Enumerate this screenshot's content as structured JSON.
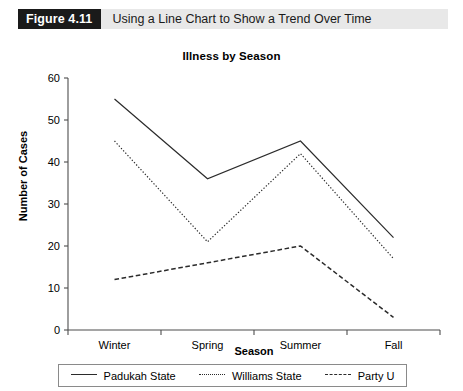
{
  "figure": {
    "number": "Figure 4.11",
    "caption": "Using a Line Chart to Show a Trend Over Time"
  },
  "chart_data": {
    "type": "line",
    "title": "Illness by Season",
    "xlabel": "Season",
    "ylabel": "Number of Cases",
    "categories": [
      "Winter",
      "Spring",
      "Summer",
      "Fall"
    ],
    "ylim": [
      0,
      60
    ],
    "yticks": [
      0,
      10,
      20,
      30,
      40,
      50,
      60
    ],
    "grid": false,
    "legend_position": "bottom",
    "series": [
      {
        "name": "Padukah State",
        "style": "solid",
        "color": "#2b2b2b",
        "values": [
          55,
          36,
          45,
          22
        ]
      },
      {
        "name": "Williams State",
        "style": "dotted",
        "color": "#2b2b2b",
        "values": [
          45,
          21,
          42,
          17
        ]
      },
      {
        "name": "Party U",
        "style": "dashed",
        "color": "#2b2b2b",
        "values": [
          12,
          16,
          20,
          3
        ]
      }
    ]
  }
}
